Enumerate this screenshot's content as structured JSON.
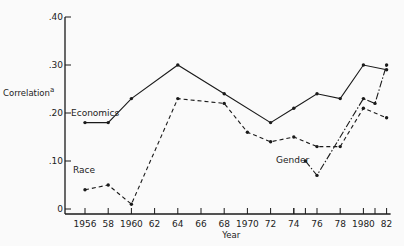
{
  "chart_data": {
    "type": "line",
    "title": "",
    "xlabel": "Year",
    "ylabel": "Correlation",
    "ylabel_superscript": "a",
    "ylim": [
      0,
      0.4
    ],
    "yticks": [
      0,
      0.1,
      0.2,
      0.3,
      0.4
    ],
    "ytick_labels": [
      "0",
      ".10",
      ".20",
      ".30",
      ".40"
    ],
    "xlim": [
      1955,
      1982
    ],
    "xticks": [
      1956,
      1958,
      1960,
      1962,
      1964,
      1966,
      1968,
      1970,
      1972,
      1974,
      1975,
      1976,
      1978,
      1980,
      1981,
      1982
    ],
    "xtick_labels": [
      "1956",
      "58",
      "1960",
      "62",
      "64",
      "66",
      "68",
      "1970",
      "72",
      "74",
      "",
      "76",
      "78",
      "1980",
      "",
      "82"
    ],
    "grid": false,
    "legend": "inline labels",
    "series": [
      {
        "name": "Economics",
        "style": "solid",
        "x": [
          1956,
          1958,
          1960,
          1964,
          1968,
          1972,
          1974,
          1976,
          1978,
          1980,
          1982
        ],
        "values": [
          0.18,
          0.18,
          0.23,
          0.3,
          0.24,
          0.18,
          0.21,
          0.24,
          0.23,
          0.3,
          0.29
        ]
      },
      {
        "name": "Race",
        "style": "dashed",
        "x": [
          1956,
          1958,
          1960,
          1964,
          1968,
          1970,
          1972,
          1974,
          1976,
          1978,
          1980,
          1982
        ],
        "values": [
          0.04,
          0.05,
          0.01,
          0.23,
          0.22,
          0.16,
          0.14,
          0.15,
          0.13,
          0.13,
          0.21,
          0.19
        ]
      },
      {
        "name": "Gender",
        "style": "dash-dot",
        "x": [
          1975,
          1976,
          1980,
          1981,
          1982
        ],
        "values": [
          0.1,
          0.07,
          0.23,
          0.22,
          0.3
        ]
      }
    ]
  }
}
